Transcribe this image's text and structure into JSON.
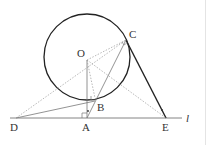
{
  "figure": {
    "labels": {
      "O": "O",
      "C": "C",
      "B": "B",
      "D": "D",
      "A": "A",
      "E": "E",
      "line": "l"
    },
    "points": {
      "O": [
        87,
        60
      ],
      "C": [
        126,
        40
      ],
      "B": [
        95,
        98
      ],
      "D": [
        16,
        118
      ],
      "A": [
        87,
        118
      ],
      "E": [
        166,
        118
      ]
    },
    "circle": {
      "center": "O",
      "radius": 42
    },
    "colors": {
      "stroke": "#222222",
      "thin": "#777777",
      "dotted": "#999999"
    }
  }
}
